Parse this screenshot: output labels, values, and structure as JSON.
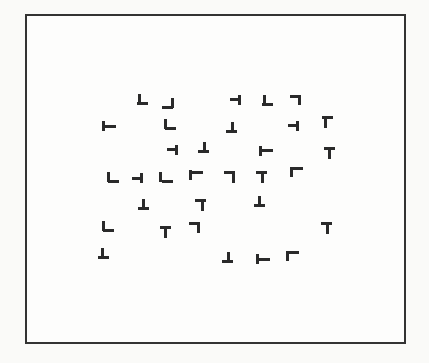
{
  "stimulus": {
    "type": "visual-search-display",
    "description": "Array of T-like and L-like line-segment items inside a rectangular frame",
    "frame": {
      "left": 25,
      "top": 14,
      "width": 381,
      "height": 330,
      "border_color": "#333333"
    },
    "ink_color": "#2a2a2a",
    "items": [
      {
        "x": 143,
        "y": 100,
        "h": {
          "dx": 0,
          "dy": 7
        },
        "v": {
          "dx": 1,
          "dy": -1
        }
      },
      {
        "x": 168,
        "y": 104,
        "h": {
          "dx": 0,
          "dy": 7
        },
        "v": {
          "dx": 9,
          "dy": -1
        }
      },
      {
        "x": 236,
        "y": 100,
        "h": {
          "dx": 0,
          "dy": 3
        },
        "v": {
          "dx": 8,
          "dy": 0
        }
      },
      {
        "x": 268,
        "y": 101,
        "h": {
          "dx": 0,
          "dy": 7
        },
        "v": {
          "dx": 1,
          "dy": -1
        }
      },
      {
        "x": 296,
        "y": 100,
        "h": {
          "dx": 0,
          "dy": 0
        },
        "v": {
          "dx": 8,
          "dy": 0
        }
      },
      {
        "x": 108,
        "y": 126,
        "h": {
          "dx": 3,
          "dy": 4
        },
        "v": {
          "dx": 0,
          "dy": 0
        }
      },
      {
        "x": 170,
        "y": 125,
        "h": {
          "dx": 1,
          "dy": 7
        },
        "v": {
          "dx": 0,
          "dy": -1
        }
      },
      {
        "x": 232,
        "y": 128,
        "h": {
          "dx": 0,
          "dy": 7
        },
        "v": {
          "dx": 5,
          "dy": -1
        }
      },
      {
        "x": 294,
        "y": 126,
        "h": {
          "dx": 0,
          "dy": 3
        },
        "v": {
          "dx": 8,
          "dy": 0
        }
      },
      {
        "x": 328,
        "y": 121,
        "h": {
          "dx": 0,
          "dy": 0
        },
        "v": {
          "dx": 2,
          "dy": 2
        }
      },
      {
        "x": 173,
        "y": 150,
        "h": {
          "dx": 0,
          "dy": 3
        },
        "v": {
          "dx": 8,
          "dy": 0
        }
      },
      {
        "x": 204,
        "y": 148,
        "h": {
          "dx": 0,
          "dy": 7
        },
        "v": {
          "dx": 5,
          "dy": -1
        }
      },
      {
        "x": 265,
        "y": 151,
        "h": {
          "dx": 3,
          "dy": 3
        },
        "v": {
          "dx": 0,
          "dy": 0
        }
      },
      {
        "x": 330,
        "y": 152,
        "h": {
          "dx": 0,
          "dy": 0
        },
        "v": {
          "dx": 4,
          "dy": 2
        }
      },
      {
        "x": 113,
        "y": 178,
        "h": {
          "dx": 1,
          "dy": 7
        },
        "v": {
          "dx": 0,
          "dy": -1
        }
      },
      {
        "x": 138,
        "y": 178,
        "h": {
          "dx": 0,
          "dy": 4
        },
        "v": {
          "dx": 8,
          "dy": 0
        }
      },
      {
        "x": 165,
        "y": 178,
        "h": {
          "dx": 3,
          "dy": 7
        },
        "v": {
          "dx": 0,
          "dy": -1
        }
      },
      {
        "x": 195,
        "y": 175,
        "h": {
          "dx": 3,
          "dy": 1
        },
        "v": {
          "dx": 0,
          "dy": 0
        }
      },
      {
        "x": 230,
        "y": 176,
        "h": {
          "dx": 0,
          "dy": 0
        },
        "v": {
          "dx": 8,
          "dy": 2
        }
      },
      {
        "x": 262,
        "y": 176,
        "h": {
          "dx": 0,
          "dy": 0
        },
        "v": {
          "dx": 5,
          "dy": 2
        }
      },
      {
        "x": 296,
        "y": 172,
        "h": {
          "dx": 2,
          "dy": 0
        },
        "v": {
          "dx": 0,
          "dy": 0
        }
      },
      {
        "x": 144,
        "y": 205,
        "h": {
          "dx": 0,
          "dy": 7
        },
        "v": {
          "dx": 4,
          "dy": -1
        }
      },
      {
        "x": 201,
        "y": 204,
        "h": {
          "dx": 0,
          "dy": 0
        },
        "v": {
          "dx": 6,
          "dy": 2
        }
      },
      {
        "x": 260,
        "y": 202,
        "h": {
          "dx": 0,
          "dy": 7
        },
        "v": {
          "dx": 4,
          "dy": -1
        }
      },
      {
        "x": 108,
        "y": 227,
        "h": {
          "dx": 1,
          "dy": 7
        },
        "v": {
          "dx": 0,
          "dy": -1
        }
      },
      {
        "x": 166,
        "y": 231,
        "h": {
          "dx": 0,
          "dy": 0
        },
        "v": {
          "dx": 4,
          "dy": 2
        }
      },
      {
        "x": 195,
        "y": 227,
        "h": {
          "dx": 0,
          "dy": 0
        },
        "v": {
          "dx": 8,
          "dy": 1
        }
      },
      {
        "x": 327,
        "y": 227,
        "h": {
          "dx": 0,
          "dy": 0
        },
        "v": {
          "dx": 5,
          "dy": 2
        }
      },
      {
        "x": 104,
        "y": 254,
        "h": {
          "dx": 0,
          "dy": 7
        },
        "v": {
          "dx": 3,
          "dy": -1
        }
      },
      {
        "x": 228,
        "y": 258,
        "h": {
          "dx": 0,
          "dy": 7
        },
        "v": {
          "dx": 5,
          "dy": -1
        }
      },
      {
        "x": 262,
        "y": 259,
        "h": {
          "dx": 3,
          "dy": 4
        },
        "v": {
          "dx": 0,
          "dy": 0
        }
      },
      {
        "x": 292,
        "y": 256,
        "h": {
          "dx": 2,
          "dy": 0
        },
        "v": {
          "dx": 0,
          "dy": 0
        }
      }
    ]
  }
}
